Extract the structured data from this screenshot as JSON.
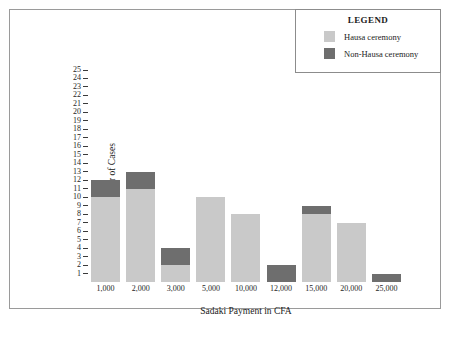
{
  "chart_data": {
    "type": "bar",
    "stacked": true,
    "title": "",
    "xlabel": "Sadaki Payment in CFA",
    "ylabel": "Number of Cases",
    "categories": [
      "1,000",
      "2,000",
      "3,000",
      "5,000",
      "10,000",
      "12,000",
      "15,000",
      "20,000",
      "25,000"
    ],
    "series": [
      {
        "name": "Hausa ceremony",
        "color": "#c9c9c9",
        "values": [
          10,
          11,
          2,
          10,
          8,
          0,
          8,
          7,
          0
        ]
      },
      {
        "name": "Non-Hausa ceremony",
        "color": "#6e6e6e",
        "values": [
          2,
          2,
          2,
          0,
          0,
          2,
          1,
          0,
          1
        ]
      }
    ],
    "totals": [
      12,
      13,
      4,
      10,
      8,
      2,
      9,
      7,
      1
    ],
    "ylim": [
      0,
      25
    ],
    "yticks": [
      1,
      2,
      3,
      4,
      5,
      6,
      7,
      8,
      9,
      10,
      11,
      12,
      13,
      14,
      15,
      16,
      17,
      18,
      19,
      20,
      21,
      22,
      23,
      24,
      25
    ],
    "ytick_labels": [
      "1",
      "2",
      "3",
      "4",
      "5",
      "6",
      "7",
      "8",
      "9",
      "10",
      "11",
      "12",
      "13",
      "14",
      "15",
      "16",
      "17",
      "18",
      "19",
      "20",
      "21",
      "22",
      "23",
      "24",
      "25"
    ],
    "grid": false,
    "legend_position": "top-right"
  },
  "legend": {
    "title": "LEGEND",
    "entries": [
      {
        "label": "Hausa ceremony",
        "color": "#c9c9c9"
      },
      {
        "label": "Non-Hausa ceremony",
        "color": "#6e6e6e"
      }
    ]
  },
  "colors": {
    "hausa": "#c9c9c9",
    "non_hausa": "#6e6e6e",
    "frame": "#9a9a9a",
    "text": "#1b1b1b"
  }
}
